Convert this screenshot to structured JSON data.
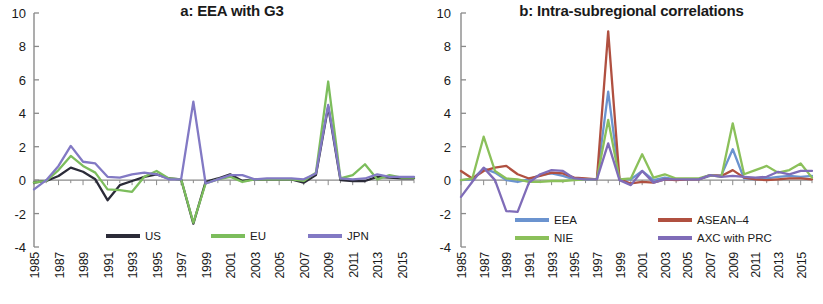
{
  "figure": {
    "panels": [
      "a",
      "b"
    ],
    "background": "#ffffff"
  },
  "panel_a": {
    "title": "a: EEA with G3",
    "legend": [
      {
        "label": "US",
        "color": "#2b2b38"
      },
      {
        "label": "EU",
        "color": "#7cbd5c"
      },
      {
        "label": "JPN",
        "color": "#8279c4"
      }
    ]
  },
  "panel_b": {
    "title": "b: Intra-subregional correlations",
    "legend": [
      {
        "label": "EEA",
        "color": "#6b93cf"
      },
      {
        "label": "ASEAN–4",
        "color": "#b05040"
      },
      {
        "label": "NIE",
        "color": "#8bc05a"
      },
      {
        "label": "AXC with PRC",
        "color": "#7f6cb8"
      }
    ]
  },
  "axis": {
    "y_ticks": [
      "10",
      "8",
      "6",
      "4",
      "2",
      "0",
      "-2",
      "-4"
    ],
    "y_values": [
      10,
      8,
      6,
      4,
      2,
      0,
      -2,
      -4
    ],
    "ylim": [
      -4,
      10
    ],
    "x_ticks": [
      "1985",
      "1987",
      "1989",
      "1991",
      "1993",
      "1995",
      "1997",
      "1999",
      "2001",
      "2003",
      "2005",
      "2007",
      "2009",
      "2011",
      "2013",
      "2015"
    ],
    "x_tick_values": [
      1985,
      1987,
      1989,
      1991,
      1993,
      1995,
      1997,
      1999,
      2001,
      2003,
      2005,
      2007,
      2009,
      2011,
      2013,
      2015
    ],
    "xlim": [
      1985,
      2016
    ]
  },
  "chart_data": [
    {
      "type": "line",
      "title": "a: EEA with G3",
      "xlabel": "",
      "ylabel": "",
      "xlim": [
        1985,
        2016
      ],
      "ylim": [
        -4,
        10
      ],
      "grid": false,
      "legend_position": "bottom",
      "x": [
        1985,
        1986,
        1987,
        1988,
        1989,
        1990,
        1991,
        1992,
        1993,
        1994,
        1995,
        1996,
        1997,
        1998,
        1999,
        2000,
        2001,
        2002,
        2003,
        2004,
        2005,
        2006,
        2007,
        2008,
        2009,
        2010,
        2011,
        2012,
        2013,
        2014,
        2015,
        2016
      ],
      "series": [
        {
          "name": "US",
          "color": "#2b2b38",
          "values": [
            -0.15,
            -0.05,
            0.25,
            0.75,
            0.5,
            0.05,
            -1.2,
            -0.3,
            -0.05,
            0.2,
            0.35,
            0.1,
            0.05,
            -2.6,
            -0.1,
            0.1,
            0.35,
            -0.05,
            0.05,
            0.05,
            0.05,
            0.05,
            -0.15,
            0.3,
            4.4,
            0.0,
            -0.05,
            -0.05,
            0.2,
            0.15,
            0.1,
            0.1
          ]
        },
        {
          "name": "EU",
          "color": "#7cbd5c",
          "values": [
            -0.15,
            -0.05,
            0.6,
            1.45,
            0.85,
            0.45,
            -0.55,
            -0.6,
            -0.7,
            0.2,
            0.55,
            0.1,
            0.05,
            -2.55,
            -0.2,
            0.05,
            0.2,
            -0.1,
            0.05,
            0.05,
            0.05,
            0.05,
            -0.05,
            0.45,
            5.9,
            0.1,
            0.3,
            0.95,
            0.05,
            0.3,
            0.15,
            0.15
          ]
        },
        {
          "name": "JPN",
          "color": "#8279c4",
          "values": [
            -0.55,
            0.0,
            0.85,
            2.05,
            1.1,
            1.0,
            0.2,
            0.15,
            0.35,
            0.45,
            0.35,
            0.05,
            0.05,
            4.7,
            -0.2,
            0.05,
            0.3,
            0.3,
            0.05,
            0.1,
            0.1,
            0.1,
            0.05,
            0.4,
            4.5,
            0.1,
            0.05,
            0.1,
            0.35,
            0.2,
            0.2,
            0.2
          ]
        }
      ]
    },
    {
      "type": "line",
      "title": "b: Intra-subregional correlations",
      "xlabel": "",
      "ylabel": "",
      "xlim": [
        1985,
        2016
      ],
      "ylim": [
        -4,
        10
      ],
      "grid": false,
      "legend_position": "bottom",
      "x": [
        1985,
        1986,
        1987,
        1988,
        1989,
        1990,
        1991,
        1992,
        1993,
        1994,
        1995,
        1996,
        1997,
        1998,
        1999,
        2000,
        2001,
        2002,
        2003,
        2004,
        2005,
        2006,
        2007,
        2008,
        2009,
        2010,
        2011,
        2012,
        2013,
        2014,
        2015,
        2016
      ],
      "series": [
        {
          "name": "EEA",
          "color": "#6b93cf",
          "values": [
            0.0,
            0.05,
            0.7,
            0.45,
            0.0,
            -0.1,
            0.05,
            0.3,
            0.4,
            0.25,
            0.05,
            0.05,
            0.05,
            5.3,
            0.05,
            0.05,
            0.55,
            0.0,
            0.15,
            0.05,
            0.05,
            0.05,
            0.25,
            0.3,
            1.85,
            0.1,
            0.05,
            0.1,
            0.2,
            0.25,
            0.2,
            0.25
          ]
        },
        {
          "name": "ASEAN–4",
          "color": "#b05040",
          "values": [
            0.55,
            0.1,
            0.55,
            0.75,
            0.85,
            0.35,
            0.1,
            0.25,
            0.45,
            0.4,
            0.15,
            0.1,
            0.05,
            8.9,
            0.05,
            -0.2,
            -0.1,
            -0.15,
            0.05,
            0.0,
            0.05,
            0.05,
            0.3,
            0.25,
            0.6,
            0.15,
            0.05,
            0.0,
            0.05,
            0.1,
            0.1,
            0.05
          ]
        },
        {
          "name": "NIE",
          "color": "#8bc05a",
          "values": [
            0.0,
            0.1,
            2.6,
            0.55,
            0.1,
            0.05,
            -0.1,
            -0.1,
            -0.05,
            -0.05,
            0.0,
            0.05,
            0.05,
            3.6,
            0.05,
            0.1,
            1.55,
            0.15,
            0.35,
            0.1,
            0.1,
            0.1,
            0.3,
            0.2,
            3.4,
            0.35,
            0.6,
            0.85,
            0.45,
            0.6,
            1.0,
            0.15
          ]
        },
        {
          "name": "AXC with PRC",
          "color": "#7f6cb8",
          "values": [
            -1.0,
            -0.1,
            0.75,
            0.0,
            -1.85,
            -1.9,
            -0.15,
            0.35,
            0.6,
            0.55,
            0.1,
            0.05,
            0.05,
            2.2,
            0.0,
            -0.3,
            0.55,
            -0.15,
            0.05,
            0.05,
            0.05,
            0.05,
            0.3,
            0.2,
            0.25,
            0.2,
            0.15,
            0.2,
            0.5,
            0.35,
            0.55,
            0.55
          ]
        }
      ]
    }
  ]
}
